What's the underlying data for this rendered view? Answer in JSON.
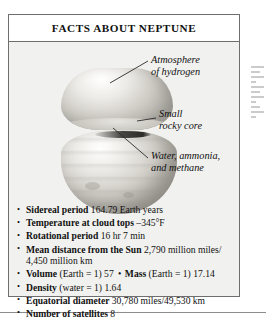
{
  "fact_box": {
    "title": "FACTS ABOUT NEPTUNE",
    "illustration": {
      "name": "neptune-cutaway-diagram",
      "callouts": [
        {
          "id": "atmosphere",
          "line1": "Atmosphere",
          "line2": "of hydrogen"
        },
        {
          "id": "core",
          "line1": "Small",
          "line2": "rocky core"
        },
        {
          "id": "water",
          "line1": "Water, ammonia,",
          "line2": "and methane"
        }
      ]
    },
    "facts": [
      {
        "label": "Sidereal period",
        "value": "164.79 Earth years"
      },
      {
        "label": "Temperature at cloud tops",
        "value": "–345°F"
      },
      {
        "label": "Rotational period",
        "value": "16 hr 7 min"
      },
      {
        "label": "Mean distance from the Sun",
        "value": "2,790 million miles/ 4,450 million km"
      },
      {
        "label": "Volume",
        "value": "(Earth = 1) 57",
        "bullet2": "•",
        "label2": "Mass",
        "value2": "(Earth = 1) 17.14"
      },
      {
        "label": "Density",
        "value": "(water = 1) 1.64"
      },
      {
        "label": "Equatorial diameter",
        "value": "30,780 miles/49,530 km"
      },
      {
        "label": "Number of satellites",
        "value": "8"
      }
    ]
  },
  "colors": {
    "border": "#6e6e6e",
    "title_bar_bg": "#ffffff",
    "body_bg": "#f1f1ef",
    "text": "#111111"
  }
}
